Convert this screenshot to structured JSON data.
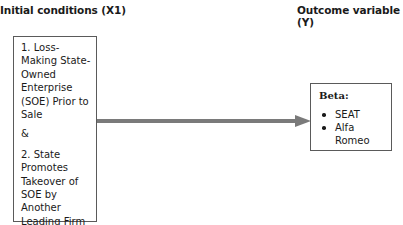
{
  "headings": {
    "left": "Initial conditions (X1)",
    "right": "Outcome variable (Y)"
  },
  "left_box": {
    "condition_1": "1. Loss-Making State-Owned Enterprise (SOE) Prior to Sale",
    "connector": "&",
    "condition_2": "2. State Promotes Takeover of SOE by Another Leading Firm"
  },
  "arrow": {
    "color": "#7a7a7a",
    "direction": "left-to-right"
  },
  "right_box": {
    "title": "Beta:",
    "items": [
      "SEAT",
      "Alfa Romeo"
    ]
  }
}
